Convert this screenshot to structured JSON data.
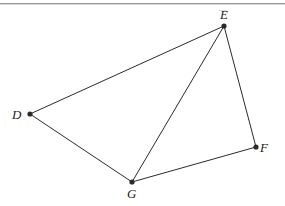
{
  "figure": {
    "type": "geometry-diagram",
    "background_color": "#ffffff",
    "stroke_color": "#2b2b2b",
    "label_color": "#1b1b1b",
    "divider_color": "#9a9ba0",
    "canvas": {
      "width": 285,
      "height": 206
    },
    "vertices": [
      {
        "id": "D",
        "label": "D",
        "x": 30,
        "y": 114,
        "label_x": 12,
        "label_y": 108
      },
      {
        "id": "E",
        "label": "E",
        "x": 224,
        "y": 26,
        "label_x": 220,
        "label_y": 8
      },
      {
        "id": "F",
        "label": "F",
        "x": 256,
        "y": 147,
        "label_x": 260,
        "label_y": 141
      },
      {
        "id": "G",
        "label": "G",
        "x": 132,
        "y": 182,
        "label_x": 127,
        "label_y": 187
      }
    ],
    "edges": [
      {
        "id": "DE",
        "from": "D",
        "to": "E"
      },
      {
        "id": "EF",
        "from": "E",
        "to": "F"
      },
      {
        "id": "FG",
        "from": "F",
        "to": "G"
      },
      {
        "id": "GD",
        "from": "G",
        "to": "D"
      },
      {
        "id": "EG",
        "from": "E",
        "to": "G"
      }
    ]
  }
}
